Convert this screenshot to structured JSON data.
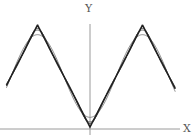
{
  "chart_data": {
    "type": "line",
    "title": "",
    "xlabel": "X",
    "ylabel": "Y",
    "xlim": [
      -5.0,
      5.1
    ],
    "ylim": [
      0,
      3.1416
    ],
    "grid": false,
    "legend": null,
    "x_ticks": [],
    "y_ticks": [],
    "series": [
      {
        "name": "triangle wave |x| (periodic)",
        "color": "#222222",
        "x": [
          -5.0,
          -3.1416,
          0,
          3.1416,
          5.1
        ],
        "y": [
          1.283,
          3.1416,
          0,
          3.1416,
          1.183
        ]
      },
      {
        "name": "Fourier partial sum, 1 term",
        "color": "#777777",
        "formula": "pi/2 - (4/pi)cos(x)"
      },
      {
        "name": "Fourier partial sum, 2 terms",
        "color": "#555555",
        "formula": "pi/2 - (4/pi)(cos(x) + cos(3x)/9)"
      },
      {
        "name": "Fourier partial sum, 3 terms",
        "color": "#444444",
        "formula": "pi/2 - (4/pi)(cos(x) + cos(3x)/9 + cos(5x)/25)"
      }
    ],
    "key_points": {
      "peaks": [
        [
          -3.1416,
          3.1416
        ],
        [
          3.1416,
          3.1416
        ]
      ],
      "minimum": [
        0,
        0
      ]
    }
  },
  "axes": {
    "x_label": "X",
    "y_label": "Y",
    "axis_color": "#999999"
  }
}
